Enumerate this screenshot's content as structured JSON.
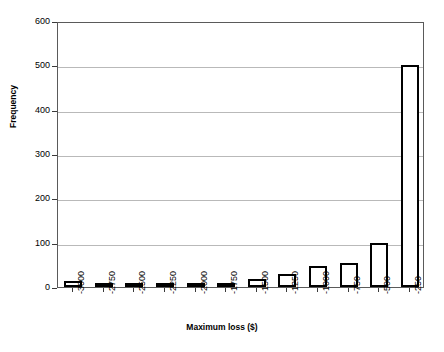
{
  "chart_data": {
    "type": "bar",
    "title": "",
    "xlabel": "Maximum loss ($)",
    "ylabel": "Frequency",
    "categories": [
      "-3000",
      "-2750",
      "-2500",
      "-2250",
      "-2000",
      "-1750",
      "-1500",
      "-1250",
      "-1000",
      "-750",
      "-500",
      "-250"
    ],
    "values": [
      13,
      5,
      8,
      5,
      10,
      3,
      18,
      30,
      47,
      55,
      100,
      500
    ],
    "ylim": [
      0,
      600
    ],
    "ytick_labels": [
      "0",
      "100",
      "200",
      "300",
      "400",
      "500",
      "600"
    ],
    "ytick_values": [
      0,
      100,
      200,
      300,
      400,
      500,
      600
    ],
    "grid": true,
    "grid_axis": "y",
    "legend": false,
    "bar_fill": "#ffffff",
    "bar_edge": "#000000",
    "grid_color": "#b9b9b9",
    "axis_color": "#5a5a5a"
  }
}
